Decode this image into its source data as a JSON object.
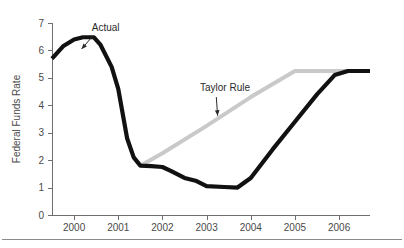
{
  "figure": {
    "background_color": "#ffffff",
    "has_bottom_rule": true
  },
  "chart_data": {
    "type": "line",
    "title": "",
    "subtitle": "",
    "xlabel": "",
    "ylabel": "Federal Funds Rate",
    "xlim": [
      1999.5,
      2006.7
    ],
    "ylim": [
      0,
      7
    ],
    "grid": false,
    "legend_position": "none",
    "x_tick_labels": [
      "2000",
      "2001",
      "2002",
      "2003",
      "2004",
      "2005",
      "2006"
    ],
    "x_tick_values": [
      2000,
      2001,
      2002,
      2003,
      2004,
      2005,
      2006
    ],
    "y_tick_labels": [
      "0",
      "1",
      "2",
      "3",
      "4",
      "5",
      "6",
      "7"
    ],
    "y_tick_values": [
      0,
      1,
      2,
      3,
      4,
      5,
      6,
      7
    ],
    "series": [
      {
        "name": "Actual",
        "color": "#111111",
        "line_width": 4.2,
        "x": [
          1999.5,
          1999.75,
          2000.0,
          2000.2,
          2000.45,
          2000.6,
          2000.85,
          2001.0,
          2001.2,
          2001.35,
          2001.5,
          2001.75,
          2002.0,
          2002.2,
          2002.5,
          2002.75,
          2003.0,
          2003.4,
          2003.7,
          2004.0,
          2004.5,
          2005.0,
          2005.5,
          2005.9,
          2006.2,
          2006.7
        ],
        "y": [
          5.7,
          6.15,
          6.4,
          6.48,
          6.48,
          6.2,
          5.4,
          4.6,
          2.8,
          2.1,
          1.8,
          1.78,
          1.75,
          1.6,
          1.35,
          1.25,
          1.05,
          1.02,
          1.0,
          1.35,
          2.4,
          3.4,
          4.4,
          5.1,
          5.25,
          5.25
        ]
      },
      {
        "name": "Taylor Rule",
        "color": "#c9c9c9",
        "line_width": 4.0,
        "x": [
          2001.5,
          2002.0,
          2003.0,
          2004.0,
          2005.0,
          2005.6,
          2006.2,
          2006.7
        ],
        "y": [
          1.8,
          2.25,
          3.25,
          4.3,
          5.25,
          5.25,
          5.25,
          5.25
        ]
      }
    ],
    "annotations": [
      {
        "text": "Actual",
        "label_x": 2000.4,
        "label_y": 6.72,
        "arrow_from_x": 2000.42,
        "arrow_from_y": 6.52,
        "arrow_to_x": 2000.17,
        "arrow_to_y": 6.05
      },
      {
        "text": "Taylor Rule",
        "label_x": 2002.85,
        "label_y": 4.52,
        "arrow_from_x": 2003.22,
        "arrow_from_y": 4.3,
        "arrow_to_x": 2003.25,
        "arrow_to_y": 3.62
      }
    ]
  }
}
